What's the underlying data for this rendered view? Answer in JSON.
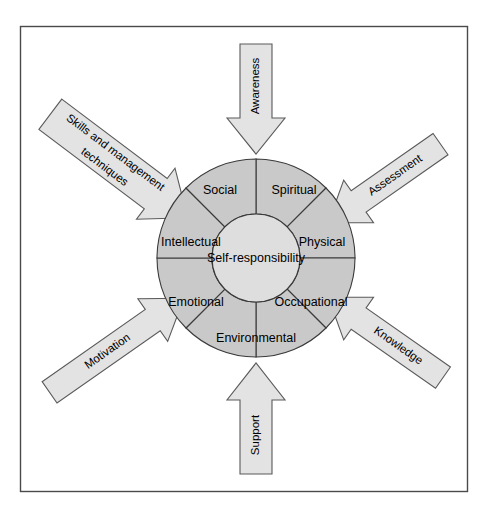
{
  "figure": {
    "background_color": "#ffffff",
    "frame_color": "#4a4a4a",
    "ring_color": "#c9c9c9",
    "hub_color": "#dedede",
    "arrow_color": "#e3e3e3",
    "arrow_outline_color": "#5a5a5a",
    "text_color": "#000000"
  },
  "hub": {
    "label": "Self-responsibility"
  },
  "wheel": {
    "sectors": [
      {
        "label": "Spiritual"
      },
      {
        "label": "Physical"
      },
      {
        "label": "Occupational"
      },
      {
        "label": "Environmental"
      },
      {
        "label": "Emotional"
      },
      {
        "label": "Intellectual"
      },
      {
        "label": "Social"
      }
    ]
  },
  "arrows": [
    {
      "label": "Awareness",
      "direction": "down"
    },
    {
      "label": "Assessment",
      "direction": "down-left"
    },
    {
      "label": "Knowledge",
      "direction": "up-left"
    },
    {
      "label": "Support",
      "direction": "up"
    },
    {
      "label": "Motivation",
      "direction": "up-right"
    },
    {
      "label": "Skills and management",
      "label_line2": "techniques",
      "direction": "down-right"
    }
  ]
}
